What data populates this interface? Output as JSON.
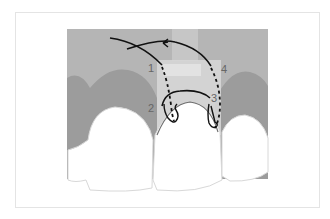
{
  "diagram": {
    "type": "dental suture technique illustration",
    "colors": {
      "background": "#ffffff",
      "frame_border": "#e4e4e4",
      "mucosa": "#b5b5b5",
      "gingiva": "#9c9c9c",
      "flap_overlay": "#d6d6d6",
      "tooth": "#ffffff",
      "tooth_outline": "#d8d8d8",
      "suture": "#111111",
      "gingival_margin_line": "#6f6f6f",
      "label": "#666666"
    },
    "labels": [
      {
        "id": "1",
        "text": "1"
      },
      {
        "id": "2",
        "text": "2"
      },
      {
        "id": "3",
        "text": "3"
      },
      {
        "id": "4",
        "text": "4"
      }
    ],
    "elements": {
      "teeth": [
        "left-lateral-incisor",
        "central-incisor",
        "right-lateral-incisor"
      ],
      "suture_direction_arrow": "left"
    }
  }
}
